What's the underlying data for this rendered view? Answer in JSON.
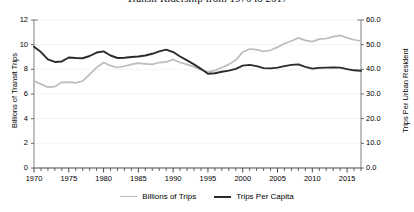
{
  "chart_data": {
    "type": "line",
    "title": "Transit Ridership from 1970 to 2017",
    "xlabel": "",
    "grid": true,
    "legend_position": "bottom",
    "x": [
      1970,
      1971,
      1972,
      1973,
      1974,
      1975,
      1976,
      1977,
      1978,
      1979,
      1980,
      1981,
      1982,
      1983,
      1984,
      1985,
      1986,
      1987,
      1988,
      1989,
      1990,
      1991,
      1992,
      1993,
      1994,
      1995,
      1996,
      1997,
      1998,
      1999,
      2000,
      2001,
      2002,
      2003,
      2004,
      2005,
      2006,
      2007,
      2008,
      2009,
      2010,
      2011,
      2012,
      2013,
      2014,
      2015,
      2016,
      2017
    ],
    "xticks": [
      1970,
      1975,
      1980,
      1985,
      1990,
      1995,
      2000,
      2005,
      2010,
      2015
    ],
    "xlim": [
      1970,
      2017
    ],
    "axes": [
      {
        "side": "left",
        "ylabel": "Billions of Transit Trips",
        "ylim": [
          0,
          12
        ],
        "yticks": [
          0,
          2,
          4,
          6,
          8,
          10,
          12
        ],
        "ytick_labels": [
          "0",
          "2",
          "4",
          "6",
          "8",
          "10",
          "12"
        ]
      },
      {
        "side": "right",
        "ylabel": "Trips Per Urban Resident",
        "ylim": [
          0,
          60
        ],
        "yticks": [
          0,
          10,
          20,
          30,
          40,
          50,
          60
        ],
        "ytick_labels": [
          "0.0",
          "10.0",
          "20.0",
          "30.0",
          "40.0",
          "50.0",
          "60.0"
        ]
      }
    ],
    "series": [
      {
        "name": "Billions of Trips",
        "axis": "left",
        "color": "#bdbdbd",
        "values": [
          7.05,
          6.8,
          6.55,
          6.6,
          6.95,
          6.97,
          6.9,
          7.05,
          7.6,
          8.15,
          8.55,
          8.3,
          8.15,
          8.25,
          8.4,
          8.5,
          8.45,
          8.4,
          8.55,
          8.6,
          8.8,
          8.55,
          8.4,
          8.2,
          7.95,
          7.8,
          7.9,
          8.15,
          8.4,
          8.75,
          9.4,
          9.65,
          9.6,
          9.45,
          9.55,
          9.8,
          10.1,
          10.3,
          10.55,
          10.35,
          10.25,
          10.45,
          10.5,
          10.65,
          10.75,
          10.55,
          10.4,
          10.3
        ]
      },
      {
        "name": "Trips Per Capita",
        "axis": "right",
        "color": "#2b2b2b",
        "values": [
          49.2,
          47.0,
          44.0,
          43.0,
          43.2,
          44.8,
          44.6,
          44.5,
          45.4,
          46.8,
          47.3,
          45.6,
          44.6,
          44.7,
          45.0,
          45.2,
          45.6,
          46.3,
          47.3,
          48.0,
          47.0,
          45.2,
          43.6,
          42.0,
          40.2,
          38.2,
          38.4,
          39.0,
          39.5,
          40.2,
          41.5,
          41.8,
          41.3,
          40.5,
          40.4,
          40.7,
          41.3,
          41.8,
          42.0,
          41.0,
          40.3,
          40.6,
          40.7,
          40.8,
          40.7,
          40.1,
          39.6,
          39.4
        ]
      }
    ]
  },
  "legend": {
    "items": [
      {
        "label": "Billions of Trips"
      },
      {
        "label": "Trips Per Capita"
      }
    ]
  }
}
